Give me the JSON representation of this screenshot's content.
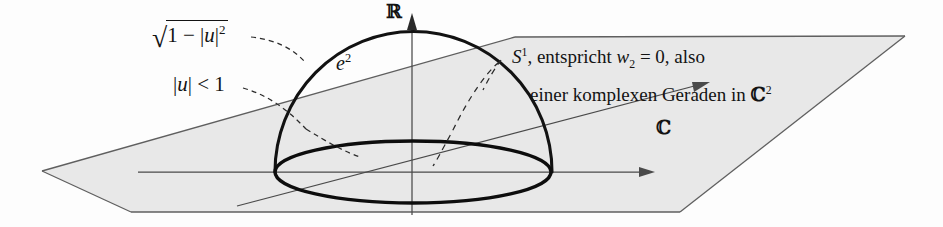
{
  "figure": {
    "name": "hemisphere-over-complex-plane-diagram",
    "background_color": "#fdfdfd",
    "ink_color": "#131313",
    "plane_fill": "#e8e8e8",
    "plane_stroke": "#6a6a6a",
    "axis_color": "#4a4a4a",
    "dome_stroke": "#121212",
    "equator_stroke": "#0d0d0d"
  },
  "labels": {
    "height_label": {
      "radical": "√",
      "radicand_pre": "1 − |",
      "radicand_var": "u",
      "radicand_post": "|",
      "radicand_exp": "2",
      "full_text": "√(1 − |u|²)"
    },
    "disk_label": {
      "pre": "|",
      "var": "u",
      "post": "| < 1",
      "full_text": "|u| < 1"
    },
    "sphere_chart_label": {
      "base": "e",
      "exp": "2",
      "full_text": "e²"
    },
    "real_axis": "ℝ",
    "complex_plane_axis": "ℂ",
    "circle_annotation": {
      "line1_sym": "S",
      "line1_sym_exp": "1",
      "line1_rest_a": ", entspricht ",
      "line1_var": "w",
      "line1_var_sub": "2",
      "line1_rest_b": " = 0, also",
      "line2_a": "einer komplexen Geraden in ",
      "line2_sym": "ℂ",
      "line2_sym_exp": "2",
      "line1_full": "S¹, entspricht w₂ = 0, also",
      "line2_full": "einer komplexen Geraden in ℂ²"
    }
  },
  "geometry": {
    "dome_apex": [
      413,
      32
    ],
    "dome_left": [
      275,
      172
    ],
    "dome_right": [
      552,
      172
    ],
    "equator_center": [
      413,
      172
    ],
    "equator_rx": 138,
    "equator_ry": 31,
    "vertical_axis_x": 412,
    "vertical_axis_top": 18,
    "vertical_axis_bottom": 215,
    "horizontal_axis_y": 172,
    "horizontal_axis_x1": 138,
    "horizontal_axis_x2": 652,
    "plane_points": "42,171 515,37 905,36 680,212 131,212"
  }
}
